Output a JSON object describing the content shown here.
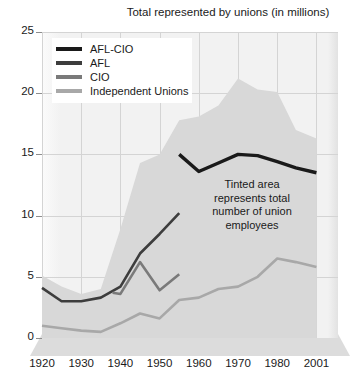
{
  "chart_data": {
    "type": "area",
    "title": "Total represented by unions (in millions)",
    "xlabel": "",
    "ylabel": "",
    "xlim": [
      1920,
      2001
    ],
    "ylim": [
      0,
      25
    ],
    "yticks": [
      0,
      5,
      10,
      15,
      20,
      25
    ],
    "xticks": [
      "1920",
      "1930",
      "1940",
      "1950",
      "1960",
      "1970",
      "1980",
      "2001"
    ],
    "grid": true,
    "legend_position": "top-left",
    "annotation": "Tinted area represents total number of union employees",
    "annotation_lines": [
      "Tinted area",
      "represents total",
      "number of union",
      "employees"
    ],
    "colors": {
      "afl_cio": "#1a1a1a",
      "afl": "#3d3d3d",
      "cio": "#7a7a7a",
      "independent": "#a8a8a8",
      "tinted_area": "#d8d8d8",
      "plot_background": "#f2f2f2",
      "gridline": "#d4d4d4"
    },
    "area": {
      "name": "Total number of union employees",
      "x": [
        1920,
        1925,
        1930,
        1935,
        1940,
        1945,
        1950,
        1955,
        1960,
        1965,
        1970,
        1975,
        1980,
        1990,
        2001
      ],
      "values": [
        5.1,
        4.2,
        3.6,
        4.0,
        8.9,
        14.3,
        15.0,
        17.8,
        18.1,
        19.0,
        21.2,
        20.3,
        20.1,
        17.0,
        16.3
      ]
    },
    "series": [
      {
        "name": "AFL-CIO",
        "color": "#1a1a1a",
        "x": [
          1955,
          1960,
          1965,
          1970,
          1975,
          1980,
          1990,
          2001
        ],
        "values": [
          15.0,
          13.6,
          14.3,
          15.0,
          14.9,
          14.4,
          13.9,
          13.5
        ]
      },
      {
        "name": "AFL",
        "color": "#3d3d3d",
        "x": [
          1920,
          1925,
          1930,
          1935,
          1940,
          1945,
          1950,
          1955
        ],
        "values": [
          4.1,
          3.0,
          3.0,
          3.3,
          4.2,
          6.9,
          8.5,
          10.2
        ]
      },
      {
        "name": "CIO",
        "color": "#7a7a7a",
        "x": [
          1938,
          1940,
          1945,
          1950,
          1955
        ],
        "values": [
          3.7,
          3.6,
          6.2,
          3.9,
          5.2
        ]
      },
      {
        "name": "Independent Unions",
        "color": "#a8a8a8",
        "x": [
          1920,
          1925,
          1930,
          1935,
          1940,
          1945,
          1950,
          1955,
          1960,
          1965,
          1970,
          1975,
          1980,
          1990,
          2001
        ],
        "values": [
          1.0,
          0.8,
          0.6,
          0.5,
          1.2,
          2.0,
          1.6,
          3.1,
          3.3,
          4.0,
          4.2,
          5.0,
          6.5,
          6.2,
          5.8
        ]
      }
    ]
  },
  "legend": {
    "items": [
      {
        "label": "AFL-CIO",
        "color": "#1a1a1a"
      },
      {
        "label": "AFL",
        "color": "#3d3d3d"
      },
      {
        "label": "CIO",
        "color": "#7a7a7a"
      },
      {
        "label": "Independent Unions",
        "color": "#a8a8a8"
      }
    ]
  },
  "annotation": {
    "line1": "Tinted area",
    "line2": "represents total",
    "line3": "number of union",
    "line4": "employees"
  }
}
